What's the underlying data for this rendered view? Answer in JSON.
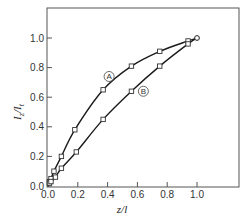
{
  "chart_data": {
    "type": "line",
    "title": "",
    "xlabel": "z/l",
    "ylabel": "I_z/I_t",
    "xlim": [
      0,
      1.2
    ],
    "ylim": [
      0,
      1.2
    ],
    "grid": false,
    "x_ticks": [
      "0.0",
      "0.2",
      "0.4",
      "0.6",
      "0.8",
      "1.0"
    ],
    "y_ticks": [
      "0.0",
      "0.2",
      "0.4",
      "0.6",
      "0.8",
      "1.0"
    ],
    "series": [
      {
        "name": "A",
        "label": "A",
        "x": [
          0.0,
          0.01,
          0.02,
          0.04,
          0.09,
          0.18,
          0.37,
          0.56,
          0.75,
          0.94,
          1.0
        ],
        "y": [
          0.0,
          0.03,
          0.05,
          0.1,
          0.2,
          0.38,
          0.65,
          0.81,
          0.91,
          0.98,
          1.0
        ]
      },
      {
        "name": "B",
        "label": "B",
        "x": [
          0.0,
          0.01,
          0.02,
          0.05,
          0.09,
          0.19,
          0.37,
          0.56,
          0.75,
          0.94,
          1.0
        ],
        "y": [
          0.0,
          0.02,
          0.03,
          0.06,
          0.12,
          0.23,
          0.45,
          0.64,
          0.81,
          0.96,
          1.0
        ]
      }
    ],
    "annotations": [
      {
        "text": "A",
        "circled": true,
        "x": 0.41,
        "y": 0.74
      },
      {
        "text": "B",
        "circled": true,
        "x": 0.64,
        "y": 0.64
      }
    ]
  }
}
